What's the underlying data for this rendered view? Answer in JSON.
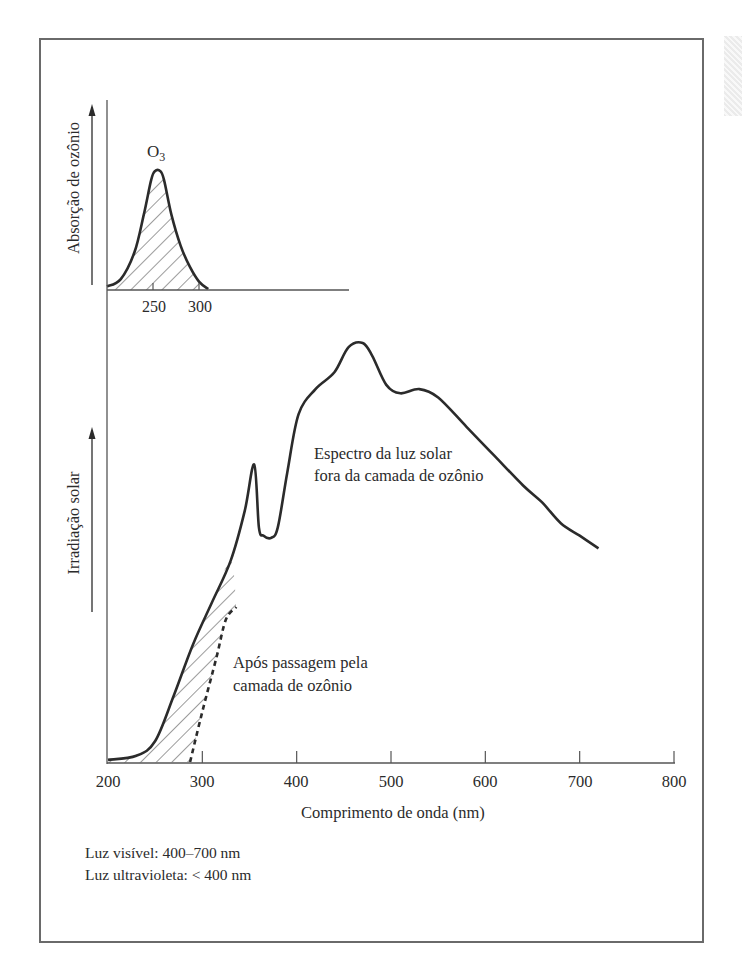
{
  "chart_data": [
    {
      "id": "ozone-absorption-inset",
      "type": "area",
      "title": "",
      "xlabel": "",
      "ylabel": "Absorção de ozônio",
      "x_ticks": [
        250,
        300
      ],
      "xlim": [
        200,
        450
      ],
      "series": [
        {
          "name": "O3",
          "label": "O₃",
          "fill": "hatched",
          "points": [
            [
              200,
              2
            ],
            [
              215,
              8
            ],
            [
              230,
              30
            ],
            [
              240,
              60
            ],
            [
              248,
              88
            ],
            [
              252,
              95
            ],
            [
              258,
              95
            ],
            [
              262,
              88
            ],
            [
              270,
              60
            ],
            [
              280,
              35
            ],
            [
              290,
              18
            ],
            [
              300,
              6
            ],
            [
              310,
              0
            ]
          ]
        }
      ],
      "grid": false
    },
    {
      "id": "solar-irradiance-main",
      "type": "line",
      "title": "",
      "xlabel": "Comprimento de onda (nm)",
      "ylabel": "Irradiação solar",
      "x_ticks": [
        200,
        300,
        400,
        500,
        600,
        700,
        800
      ],
      "xlim": [
        200,
        800
      ],
      "ylim": [
        0,
        100
      ],
      "grid": false,
      "series": [
        {
          "name": "Espectro da luz solar fora da camada de ozônio",
          "style": "solid",
          "points": [
            [
              200,
              0.5
            ],
            [
              230,
              1.5
            ],
            [
              250,
              5
            ],
            [
              270,
              16
            ],
            [
              290,
              28
            ],
            [
              310,
              38
            ],
            [
              330,
              48
            ],
            [
              345,
              60
            ],
            [
              355,
              71
            ],
            [
              360,
              56
            ],
            [
              365,
              54
            ],
            [
              373,
              53.5
            ],
            [
              380,
              56
            ],
            [
              390,
              69
            ],
            [
              402,
              83
            ],
            [
              420,
              89
            ],
            [
              440,
              93
            ],
            [
              455,
              99
            ],
            [
              470,
              100
            ],
            [
              480,
              97
            ],
            [
              495,
              90
            ],
            [
              510,
              88
            ],
            [
              530,
              89
            ],
            [
              550,
              87
            ],
            [
              580,
              80
            ],
            [
              610,
              73
            ],
            [
              640,
              66
            ],
            [
              660,
              62
            ],
            [
              680,
              57
            ],
            [
              700,
              54
            ],
            [
              720,
              51
            ]
          ]
        },
        {
          "name": "Após passagem pela camada de ozônio",
          "style": "dashed",
          "points": [
            [
              287,
              0
            ],
            [
              300,
              12
            ],
            [
              315,
              25
            ],
            [
              325,
              34
            ],
            [
              336,
              37
            ]
          ]
        }
      ],
      "annotations": [
        {
          "text": "Espectro da luz solar",
          "x": 550,
          "y": 75
        },
        {
          "text": "fora da camada de ozônio",
          "x": 550,
          "y": 69
        },
        {
          "text": "Após passagem pela",
          "x": 400,
          "y": 22
        },
        {
          "text": "camada de ozônio",
          "x": 400,
          "y": 16
        }
      ]
    }
  ],
  "labels": {
    "inset_ylabel": "Absorção de ozônio",
    "inset_series": "O",
    "inset_series_sub": "3",
    "inset_ticks": [
      "250",
      "300"
    ],
    "main_ylabel": "Irradiação solar",
    "main_xlabel": "Comprimento de onda (nm)",
    "main_ticks": [
      "200",
      "300",
      "400",
      "500",
      "600",
      "700",
      "800"
    ],
    "outside_line1": "Espectro da luz solar",
    "outside_line2": "fora da camada de ozônio",
    "after_line1": "Após passagem pela",
    "after_line2": "camada de ozônio"
  },
  "notes": {
    "visible": "Luz visível: 400–700 nm",
    "ultraviolet": "Luz ultravioleta: < 400 nm"
  },
  "colors": {
    "ink": "#2b2b2b",
    "frame": "#6a6a6a",
    "background": "#ffffff"
  }
}
